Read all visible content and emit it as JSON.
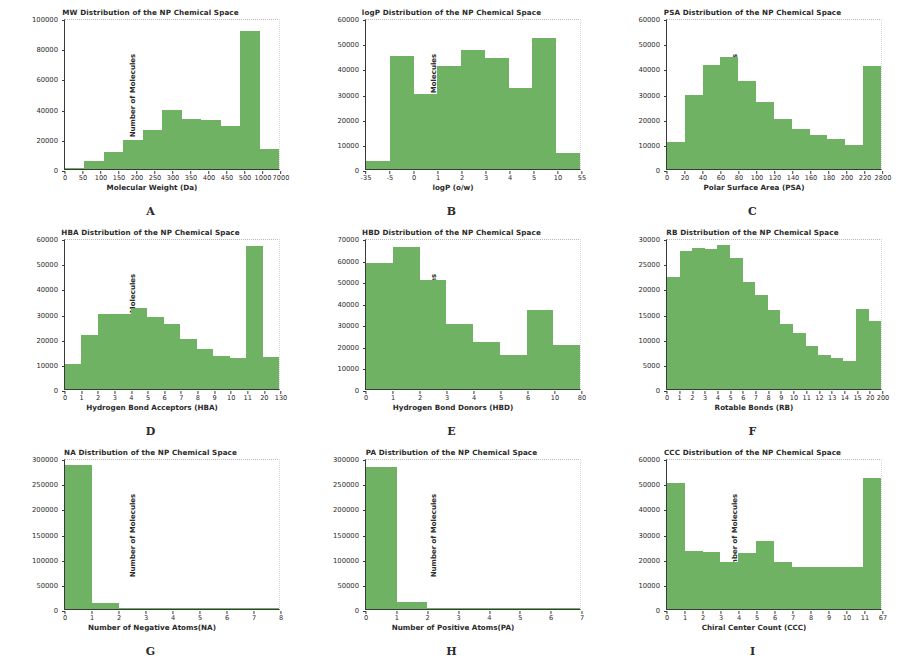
{
  "figure": {
    "background": "#ffffff",
    "bar_color": "#6fb263",
    "axis_color": "#3a3a3a",
    "ylabel_common": "Number of Molecules"
  },
  "chart_data": [
    {
      "id": "A",
      "panel_letter": "A",
      "type": "bar",
      "title": "MW Distribution of the NP Chemical Space",
      "xlabel": "Molecular Weight (Da)",
      "ylabel": "Number of Molecules",
      "ylim": [
        0,
        100000
      ],
      "yticks": [
        0,
        20000,
        40000,
        60000,
        80000,
        100000
      ],
      "categories": [
        "0",
        "50",
        "100",
        "150",
        "200",
        "250",
        "300",
        "350",
        "400",
        "450",
        "500",
        "1000",
        "7000"
      ],
      "values": [
        400,
        5000,
        11000,
        19500,
        26000,
        39000,
        33000,
        32500,
        28500,
        91500,
        13500
      ],
      "grid": false,
      "legend": "none"
    },
    {
      "id": "B",
      "panel_letter": "B",
      "type": "bar",
      "title": "logP Distribution of the NP Chemical Space",
      "xlabel": "logP (o/w)",
      "ylabel": "Number of Molecules",
      "ylim": [
        0,
        60000
      ],
      "yticks": [
        0,
        10000,
        20000,
        30000,
        40000,
        50000,
        60000
      ],
      "categories": [
        "-35",
        "-5",
        "0",
        "1",
        "2",
        "3",
        "4",
        "5",
        "10",
        "55"
      ],
      "values": [
        3000,
        44800,
        29900,
        41000,
        47400,
        44200,
        32100,
        52000,
        6300
      ],
      "grid": false,
      "legend": "none"
    },
    {
      "id": "C",
      "panel_letter": "C",
      "type": "bar",
      "title": "PSA Distribution of the NP Chemical Space",
      "xlabel": "Polar Surface Area (PSA)",
      "ylabel": "Number of Molecules",
      "ylim": [
        0,
        60000
      ],
      "yticks": [
        0,
        10000,
        20000,
        30000,
        40000,
        50000,
        60000
      ],
      "categories": [
        "0",
        "20",
        "40",
        "60",
        "80",
        "100",
        "120",
        "140",
        "160",
        "180",
        "200",
        "220",
        "2800"
      ],
      "values": [
        10700,
        29500,
        41500,
        44500,
        35000,
        26500,
        19800,
        16000,
        13500,
        12000,
        9500,
        41000
      ],
      "grid": false,
      "legend": "none"
    },
    {
      "id": "D",
      "panel_letter": "D",
      "type": "bar",
      "title": "HBA Distribution of the NP Chemical Space",
      "xlabel": "Hydrogen Bond Acceptors (HBA)",
      "ylabel": "Number of Molecules",
      "ylim": [
        0,
        60000
      ],
      "yticks": [
        0,
        10000,
        20000,
        30000,
        40000,
        50000,
        60000
      ],
      "categories": [
        "0",
        "1",
        "2",
        "3",
        "4",
        "5",
        "6",
        "7",
        "8",
        "9",
        "10",
        "11",
        "20",
        "130"
      ],
      "values": [
        10000,
        21500,
        30000,
        30000,
        32000,
        28500,
        26000,
        20000,
        16000,
        13100,
        12500,
        57000,
        12800
      ],
      "grid": false,
      "legend": "none"
    },
    {
      "id": "E",
      "panel_letter": "E",
      "type": "bar",
      "title": "HBD Distribution of the NP Chemical Space",
      "xlabel": "Hydrogen Bond Donors (HBD)",
      "ylabel": "Number of Molecules",
      "ylim": [
        0,
        70000
      ],
      "yticks": [
        0,
        10000,
        20000,
        30000,
        40000,
        50000,
        60000,
        70000
      ],
      "categories": [
        "0",
        "1",
        "2",
        "3",
        "4",
        "5",
        "6",
        "10",
        "80"
      ],
      "values": [
        58500,
        66000,
        50500,
        30000,
        21800,
        15800,
        36800,
        20300
      ],
      "grid": false,
      "legend": "none"
    },
    {
      "id": "F",
      "panel_letter": "F",
      "type": "bar",
      "title": "RB Distribution of the NP Chemical Space",
      "xlabel": "Rotable Bonds (RB)",
      "ylabel": "Number of Molecules",
      "ylim": [
        0,
        30000
      ],
      "yticks": [
        0,
        5000,
        10000,
        15000,
        20000,
        25000,
        30000
      ],
      "categories": [
        "0",
        "1",
        "2",
        "3",
        "4",
        "5",
        "6",
        "7",
        "8",
        "9",
        "10",
        "11",
        "12",
        "13",
        "14",
        "15",
        "20",
        "200"
      ],
      "values": [
        22300,
        27400,
        28000,
        27800,
        28700,
        26100,
        21200,
        18600,
        15600,
        13000,
        11100,
        8500,
        6800,
        6100,
        5600,
        15900,
        13500
      ],
      "grid": false,
      "legend": "none"
    },
    {
      "id": "G",
      "panel_letter": "G",
      "type": "bar",
      "title": "NA Distribution of the NP Chemical Space",
      "xlabel": "Number of Negative Atoms(NA)",
      "ylabel": "Number of Molecules",
      "ylim": [
        0,
        300000
      ],
      "yticks": [
        0,
        50000,
        100000,
        150000,
        200000,
        250000,
        300000
      ],
      "categories": [
        "0",
        "1",
        "2",
        "3",
        "4",
        "5",
        "6",
        "7",
        "8"
      ],
      "values": [
        285500,
        12000,
        1500,
        200,
        60,
        20,
        10,
        5
      ],
      "grid": false,
      "legend": "none"
    },
    {
      "id": "H",
      "panel_letter": "H",
      "type": "bar",
      "title": "PA Distribution of the NP Chemical Space",
      "xlabel": "Number of Positive Atoms(PA)",
      "ylabel": "Number of Molecules",
      "ylim": [
        0,
        300000
      ],
      "yticks": [
        0,
        50000,
        100000,
        150000,
        200000,
        250000,
        300000
      ],
      "categories": [
        "0",
        "1",
        "2",
        "3",
        "4",
        "5",
        "6",
        "7"
      ],
      "values": [
        283000,
        13000,
        1200,
        150,
        40,
        15,
        5
      ],
      "grid": false,
      "legend": "none"
    },
    {
      "id": "I",
      "panel_letter": "I",
      "type": "bar",
      "title": "CCC Distribution of the NP Chemical Space",
      "xlabel": "Chiral Center Count (CCC)",
      "ylabel": "Number of Molecules",
      "ylim": [
        0,
        60000
      ],
      "yticks": [
        0,
        10000,
        20000,
        30000,
        40000,
        50000,
        60000
      ],
      "categories": [
        "0",
        "1",
        "2",
        "3",
        "4",
        "5",
        "6",
        "7",
        "8",
        "9",
        "10",
        "11",
        "67"
      ],
      "values": [
        50000,
        23000,
        22500,
        18700,
        22400,
        27000,
        18500,
        16600,
        16600,
        16600,
        16600,
        52000
      ],
      "grid": false,
      "legend": "none"
    }
  ]
}
